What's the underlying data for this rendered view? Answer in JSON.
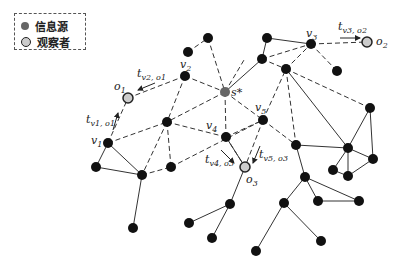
{
  "legend": {
    "items": [
      {
        "label": "信息源",
        "symbol": "filled-gray-circle",
        "color": "#666666"
      },
      {
        "label": "观察者",
        "symbol": "outlined-light-circle",
        "color": "#cccccc"
      }
    ]
  },
  "labels": {
    "source": "s*",
    "v1": "v",
    "v1_sub": "1",
    "v2": "v",
    "v2_sub": "2",
    "v3": "v",
    "v3_sub": "3",
    "v4": "v",
    "v4_sub": "4",
    "v5": "v",
    "v5_sub": "5",
    "o1": "o",
    "o1_sub": "1",
    "o2": "o",
    "o2_sub": "2",
    "o3": "o",
    "o3_sub": "3",
    "t_v1_o1": "t",
    "t_v1_o1_sub": "v1, o1",
    "t_v2_o1": "t",
    "t_v2_o1_sub": "v2, o1",
    "t_v3_o2": "t",
    "t_v3_o2_sub": "v3, o2",
    "t_v4_o3": "t",
    "t_v4_o3_sub": "v4, o3",
    "t_v5_o3": "t",
    "t_v5_o3_sub": "v5, o3"
  },
  "colors": {
    "node": "#111111",
    "source": "#666666",
    "observer_fill": "#cccccc",
    "edge": "#333333"
  }
}
